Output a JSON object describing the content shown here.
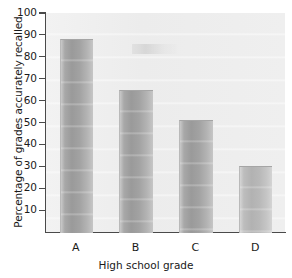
{
  "chart_data": {
    "type": "bar",
    "title": "",
    "subtitle": "",
    "xlabel": "High school grade",
    "ylabel": "Percentage of grades accurately recalled",
    "categories": [
      "A",
      "B",
      "C",
      "D"
    ],
    "values": [
      88,
      65,
      51,
      30
    ],
    "series": [
      {
        "name": "Percentage of grades accurately recalled",
        "values": [
          88,
          65,
          51,
          30
        ]
      }
    ],
    "ylim": [
      0,
      100
    ],
    "yticks": [
      10,
      20,
      30,
      40,
      50,
      60,
      70,
      80,
      90,
      100
    ],
    "yticklabels": [
      "10",
      "20",
      "30",
      "40",
      "50",
      "60",
      "70",
      "80",
      "90",
      "100"
    ],
    "xticklabels": [
      "A",
      "B",
      "C",
      "D"
    ],
    "grid": false,
    "legend": null,
    "legend_position": "none",
    "annotations": [],
    "colors": {
      "plot_background": "#eeeeee",
      "figure_background": "#ffffff",
      "axis": "#4a4a4a",
      "bar_fill": "#a8a8a8",
      "bar_fill_light": "#bdbdbd",
      "text": "#1a1a1a"
    },
    "bar_shading": [
      "normal",
      "normal",
      "normal",
      "light"
    ]
  }
}
